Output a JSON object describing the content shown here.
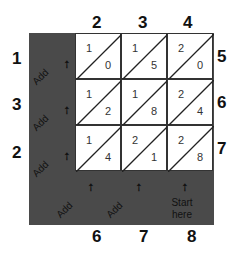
{
  "top_digits": [
    "2",
    "3",
    "4"
  ],
  "right_digits": [
    "5",
    "6",
    "7"
  ],
  "left_results": [
    "1",
    "3",
    "2"
  ],
  "bottom_results": [
    "6",
    "7",
    "8"
  ],
  "cells": [
    [
      {
        "tens": "1",
        "ones": "0"
      },
      {
        "tens": "1",
        "ones": "5"
      },
      {
        "tens": "2",
        "ones": "0"
      }
    ],
    [
      {
        "tens": "1",
        "ones": "2"
      },
      {
        "tens": "1",
        "ones": "8"
      },
      {
        "tens": "2",
        "ones": "4"
      }
    ],
    [
      {
        "tens": "1",
        "ones": "4"
      },
      {
        "tens": "2",
        "ones": "1"
      },
      {
        "tens": "2",
        "ones": "8"
      }
    ]
  ],
  "add_label": "Add",
  "arrow_glyph": "➚",
  "start_label_line1": "Start",
  "start_label_line2": "here",
  "colors": {
    "dark_band": "#4a4a4a",
    "cell_bg": "#ffffff"
  }
}
